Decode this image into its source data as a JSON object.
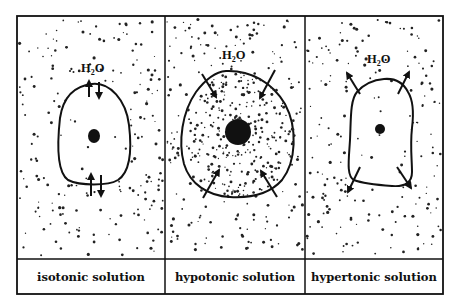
{
  "colors": {
    "ink": "#111111",
    "background": "#ffffff"
  },
  "molecule_label": {
    "main": "H",
    "subscript": "2",
    "suffix": "O"
  },
  "panels": [
    {
      "id": "isotonic",
      "label": "isotonic solution",
      "cell_shape": "oval",
      "water_flow": "both directions (equilibrium)",
      "arrows": "bidirectional pairs at top and bottom"
    },
    {
      "id": "hypotonic",
      "label": "hypotonic solution",
      "cell_shape": "swollen round",
      "water_flow": "into cell",
      "arrows": "four arrows pointing inward"
    },
    {
      "id": "hypertonic",
      "label": "hypertonic solution",
      "cell_shape": "shrunken irregular",
      "water_flow": "out of cell",
      "arrows": "four arrows pointing outward"
    }
  ],
  "frame": {
    "left": 17,
    "top": 16,
    "right": 443,
    "label_divider": 259,
    "bottom": 294,
    "dividers_x": [
      165,
      305
    ]
  }
}
